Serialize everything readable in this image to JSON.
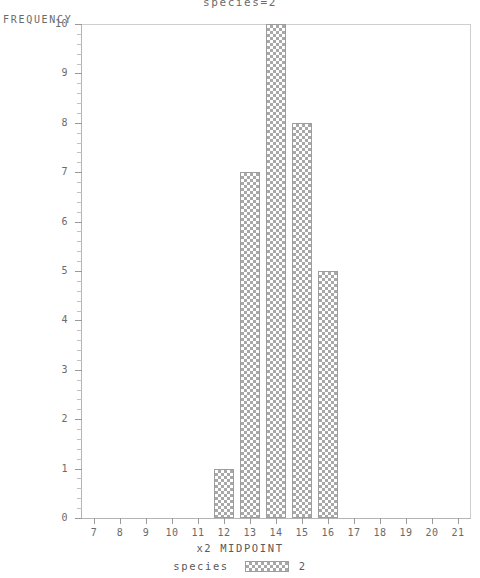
{
  "chart_data": {
    "type": "bar",
    "title": "species=2",
    "xlabel": "x2 MIDPOINT",
    "ylabel": "FREQUENCY",
    "categories": [
      12,
      13,
      14,
      15,
      16
    ],
    "values": [
      1,
      7,
      10,
      8,
      5
    ],
    "xlim": [
      6.5,
      21.5
    ],
    "ylim": [
      0,
      10
    ],
    "x_ticks": [
      7,
      8,
      9,
      10,
      11,
      12,
      13,
      14,
      15,
      16,
      17,
      18,
      19,
      20,
      21
    ],
    "y_ticks": [
      0,
      1,
      2,
      3,
      4,
      5,
      6,
      7,
      8,
      9,
      10
    ],
    "y_minor_ticks_per_major": 4,
    "grid": false,
    "legend": {
      "position": "bottom",
      "title": "species",
      "entries": [
        {
          "label": "2",
          "pattern": "crosshatch"
        }
      ]
    },
    "colors": {
      "bar_fill": "#ffffff",
      "bar_pattern": "#a8a8a8",
      "bar_edge": "#9d9d9d",
      "axis": "#b4b4b4",
      "frame": "#cfcfcf",
      "text": "#6a6a6a",
      "background": "#ffffff"
    }
  }
}
